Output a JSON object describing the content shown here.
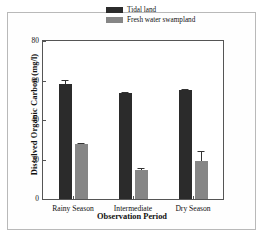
{
  "chart_data": {
    "type": "bar",
    "title": "",
    "xlabel": "Observation Period",
    "ylabel": "Dissolved Organic Carbon (mg/l)",
    "categories": [
      "Rainy Season",
      "Intermediate",
      "Dry Season"
    ],
    "ylim": [
      0,
      80
    ],
    "yticks": [
      0,
      20,
      40,
      60,
      80
    ],
    "ytick_labels": [
      "0",
      "20",
      "40",
      "60",
      "80"
    ],
    "grid": false,
    "legend_position": "top-right-inside",
    "series": [
      {
        "name": "Tidal land",
        "color": "#2b2b2b",
        "values": [
          58.3,
          53.5,
          55.0
        ],
        "errors": [
          1.8,
          0.5,
          0.8
        ]
      },
      {
        "name": "Fresh water swampland",
        "color": "#868686",
        "values": [
          27.8,
          14.8,
          19.2
        ],
        "errors": [
          0.8,
          0.9,
          5.0
        ]
      }
    ]
  },
  "legend": {
    "items": [
      {
        "label": "Tidal land",
        "color": "#2b2b2b"
      },
      {
        "label": "Fresh water swampland",
        "color": "#868686"
      }
    ]
  },
  "axes": {
    "y_title": "Dissolved Organic Carbon (mg/l)",
    "x_title": "Observation Period"
  }
}
